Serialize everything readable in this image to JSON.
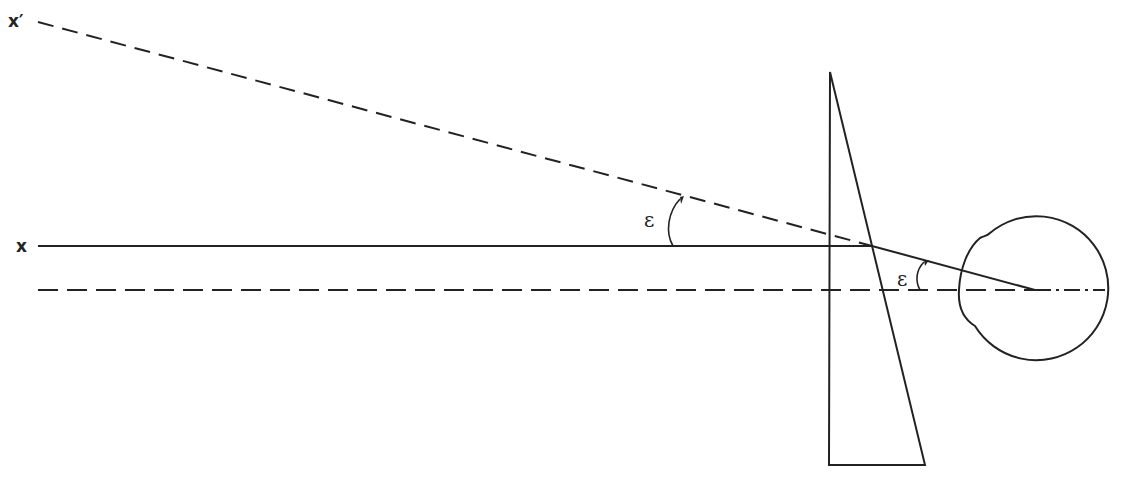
{
  "diagram": {
    "labels": {
      "x_prime": "x′",
      "x": "x",
      "epsilon_1": "ε",
      "epsilon_2": "ε"
    },
    "elements": {
      "prism": {
        "apex": [
          830,
          72
        ],
        "base_left": [
          829,
          465
        ],
        "base_right": [
          925,
          465
        ]
      },
      "eye": {
        "center": [
          1035,
          290
        ],
        "radius": 72
      },
      "object_ray_x": {
        "from": [
          38,
          246
        ],
        "to": [
          872,
          246
        ],
        "style": "solid"
      },
      "apparent_ray_x_prime": {
        "from": [
          38,
          22
        ],
        "to": [
          872,
          246
        ],
        "style": "dashed"
      },
      "refracted_ray": {
        "from": [
          872,
          246
        ],
        "to": [
          1035,
          290
        ],
        "style": "solid"
      },
      "optical_axis": {
        "from": [
          38,
          290
        ],
        "to": [
          1105,
          290
        ],
        "style": "dashed"
      }
    },
    "colors": {
      "stroke": "#222222",
      "background": "#ffffff"
    }
  }
}
